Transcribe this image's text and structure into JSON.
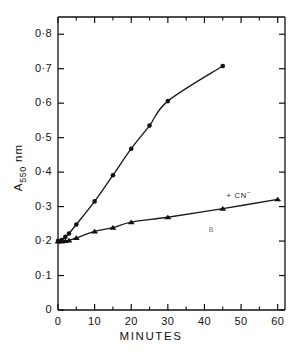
{
  "chart_data": {
    "type": "line",
    "title": "",
    "xlabel": "MINUTES",
    "ylabel": "A550 nm",
    "ylabel_base": "A",
    "ylabel_sub": "550",
    "ylabel_unit": "nm",
    "xlim": [
      0,
      62
    ],
    "ylim": [
      0,
      0.85
    ],
    "grid": false,
    "legend_position": "inline-annotation",
    "x_ticks": [
      0,
      10,
      20,
      30,
      40,
      50,
      60
    ],
    "x_tick_labels": [
      "0",
      "10",
      "20",
      "30",
      "40",
      "50",
      "60"
    ],
    "x_minor_ticks": [
      5,
      15,
      25,
      35,
      45,
      55
    ],
    "y_ticks": [
      0,
      0.1,
      0.2,
      0.3,
      0.4,
      0.5,
      0.6,
      0.7,
      0.8
    ],
    "y_tick_labels": [
      "0",
      "0·1",
      "0·2",
      "0·3",
      "0·4",
      "0·5",
      "0·6",
      "0·7",
      "0·8"
    ],
    "series": [
      {
        "name": "control",
        "marker": "circle",
        "x": [
          0,
          1,
          2,
          3,
          5,
          10,
          15,
          20,
          25,
          30,
          45
        ],
        "values": [
          0.2,
          0.203,
          0.212,
          0.222,
          0.248,
          0.315,
          0.391,
          0.468,
          0.535,
          0.606,
          0.708
        ]
      },
      {
        "name": "+ CN⁻",
        "marker": "triangle",
        "x": [
          0,
          1,
          2,
          3,
          5,
          10,
          15,
          20,
          30,
          45,
          60
        ],
        "values": [
          0.199,
          0.199,
          0.2,
          0.202,
          0.209,
          0.228,
          0.239,
          0.255,
          0.269,
          0.294,
          0.321
        ]
      }
    ],
    "annotations": [
      {
        "text": "+ CN⁻",
        "text_base": "+ CN",
        "text_sup": "−",
        "x": 52,
        "y": 0.335
      },
      {
        "text": "B",
        "x": 42,
        "y": 0.228
      }
    ],
    "colors": {
      "line": "#1a1a1a",
      "marker": "#111111",
      "axis": "#111111",
      "background": "#ffffff"
    }
  }
}
